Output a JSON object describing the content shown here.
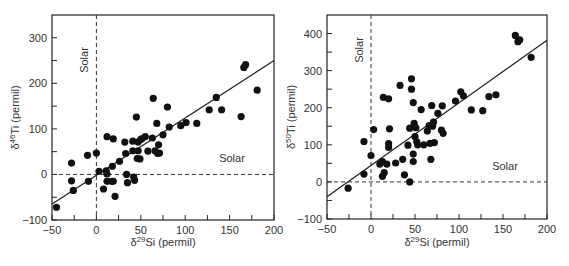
{
  "chart_data": [
    {
      "type": "scatter",
      "title": "",
      "xlabel": "δ29Si (permil)",
      "ylabel": "δ46Ti (permil)",
      "xlabel_parts": {
        "delta": "δ",
        "sup": "29",
        "rest": "Si (permil)"
      },
      "ylabel_parts": {
        "delta": "δ",
        "sup": "46",
        "rest": "Ti (permil)"
      },
      "xlim": [
        -50,
        200
      ],
      "ylim": [
        -100,
        350
      ],
      "xticks": [
        -50,
        0,
        50,
        100,
        150,
        200
      ],
      "yticks": [
        -100,
        0,
        100,
        200,
        300
      ],
      "grid": false,
      "annotations": [
        {
          "text": "Solar",
          "orientation": "vertical",
          "at_x": 0
        },
        {
          "text": "Solar",
          "orientation": "horizontal",
          "at_y": 0
        }
      ],
      "reference_lines": [
        {
          "type": "dashed",
          "axis": "x",
          "value": 0
        },
        {
          "type": "dashed",
          "axis": "y",
          "value": 0
        }
      ],
      "fit_line": {
        "x": [
          -50,
          200
        ],
        "y": [
          -65,
          250
        ]
      },
      "points": [
        [
          -45,
          -72
        ],
        [
          -28,
          25
        ],
        [
          -28,
          -14
        ],
        [
          -26,
          -35
        ],
        [
          -10,
          42
        ],
        [
          -9,
          -15
        ],
        [
          0,
          47
        ],
        [
          3,
          7
        ],
        [
          8,
          -32
        ],
        [
          11,
          8
        ],
        [
          12,
          83
        ],
        [
          12,
          1
        ],
        [
          12,
          -15
        ],
        [
          17,
          -15
        ],
        [
          18,
          18
        ],
        [
          19,
          78
        ],
        [
          19,
          -15
        ],
        [
          21,
          -48
        ],
        [
          26,
          29
        ],
        [
          32,
          71
        ],
        [
          33,
          46
        ],
        [
          34,
          0
        ],
        [
          35,
          -18
        ],
        [
          41,
          52
        ],
        [
          41,
          73
        ],
        [
          42,
          -6
        ],
        [
          43,
          -13
        ],
        [
          45,
          126
        ],
        [
          46,
          35
        ],
        [
          47,
          52
        ],
        [
          47,
          71
        ],
        [
          49,
          34
        ],
        [
          50,
          77
        ],
        [
          51,
          78
        ],
        [
          55,
          83
        ],
        [
          58,
          51
        ],
        [
          63,
          80
        ],
        [
          64,
          167
        ],
        [
          66,
          52
        ],
        [
          68,
          112
        ],
        [
          69,
          46
        ],
        [
          70,
          65
        ],
        [
          71,
          47
        ],
        [
          75,
          87
        ],
        [
          80,
          148
        ],
        [
          82,
          104
        ],
        [
          95,
          107
        ],
        [
          101,
          114
        ],
        [
          113,
          112
        ],
        [
          127,
          142
        ],
        [
          135,
          169
        ],
        [
          141,
          142
        ],
        [
          163,
          127
        ],
        [
          166,
          235
        ],
        [
          168,
          241
        ],
        [
          181,
          185
        ]
      ]
    },
    {
      "type": "scatter",
      "title": "",
      "xlabel": "δ29Si (permil)",
      "ylabel": "δ50Ti (permil)",
      "xlabel_parts": {
        "delta": "δ",
        "sup": "29",
        "rest": "Si (permil)"
      },
      "ylabel_parts": {
        "delta": "δ",
        "sup": "50",
        "rest": "Ti (permil)"
      },
      "xlim": [
        -50,
        200
      ],
      "ylim": [
        -100,
        450
      ],
      "xticks": [
        -50,
        0,
        50,
        100,
        150,
        200
      ],
      "yticks": [
        -100,
        0,
        100,
        200,
        300,
        400
      ],
      "grid": false,
      "annotations": [
        {
          "text": "Solar",
          "orientation": "vertical",
          "at_x": 0
        },
        {
          "text": "Solar",
          "orientation": "horizontal",
          "at_y": 0
        }
      ],
      "reference_lines": [
        {
          "type": "dashed",
          "axis": "x",
          "value": 0
        },
        {
          "type": "dashed",
          "axis": "y",
          "value": 0
        }
      ],
      "fit_line": {
        "x": [
          -50,
          200
        ],
        "y": [
          -40,
          382
        ]
      },
      "points": [
        [
          -26,
          -17
        ],
        [
          -8,
          109
        ],
        [
          -8,
          21
        ],
        [
          0,
          71
        ],
        [
          3,
          141
        ],
        [
          10,
          48
        ],
        [
          13,
          55
        ],
        [
          13,
          15
        ],
        [
          14,
          228
        ],
        [
          15,
          25
        ],
        [
          18,
          48
        ],
        [
          20,
          93
        ],
        [
          20,
          224
        ],
        [
          20,
          103
        ],
        [
          21,
          143
        ],
        [
          28,
          51
        ],
        [
          33,
          260
        ],
        [
          36,
          61
        ],
        [
          38,
          19
        ],
        [
          42,
          99
        ],
        [
          44,
          145
        ],
        [
          44,
          0
        ],
        [
          46,
          278
        ],
        [
          46,
          250
        ],
        [
          48,
          214
        ],
        [
          48,
          75
        ],
        [
          48,
          55
        ],
        [
          49,
          158
        ],
        [
          50,
          122
        ],
        [
          51,
          146
        ],
        [
          52,
          108
        ],
        [
          53,
          100
        ],
        [
          57,
          195
        ],
        [
          60,
          100
        ],
        [
          64,
          137
        ],
        [
          66,
          152
        ],
        [
          67,
          104
        ],
        [
          68,
          61
        ],
        [
          69,
          206
        ],
        [
          70,
          150
        ],
        [
          71,
          161
        ],
        [
          72,
          106
        ],
        [
          76,
          185
        ],
        [
          80,
          140
        ],
        [
          81,
          205
        ],
        [
          82,
          131
        ],
        [
          96,
          218
        ],
        [
          102,
          243
        ],
        [
          105,
          232
        ],
        [
          114,
          194
        ],
        [
          127,
          192
        ],
        [
          134,
          230
        ],
        [
          142,
          235
        ],
        [
          164,
          395
        ],
        [
          167,
          378
        ],
        [
          169,
          383
        ],
        [
          182,
          336
        ]
      ]
    }
  ]
}
